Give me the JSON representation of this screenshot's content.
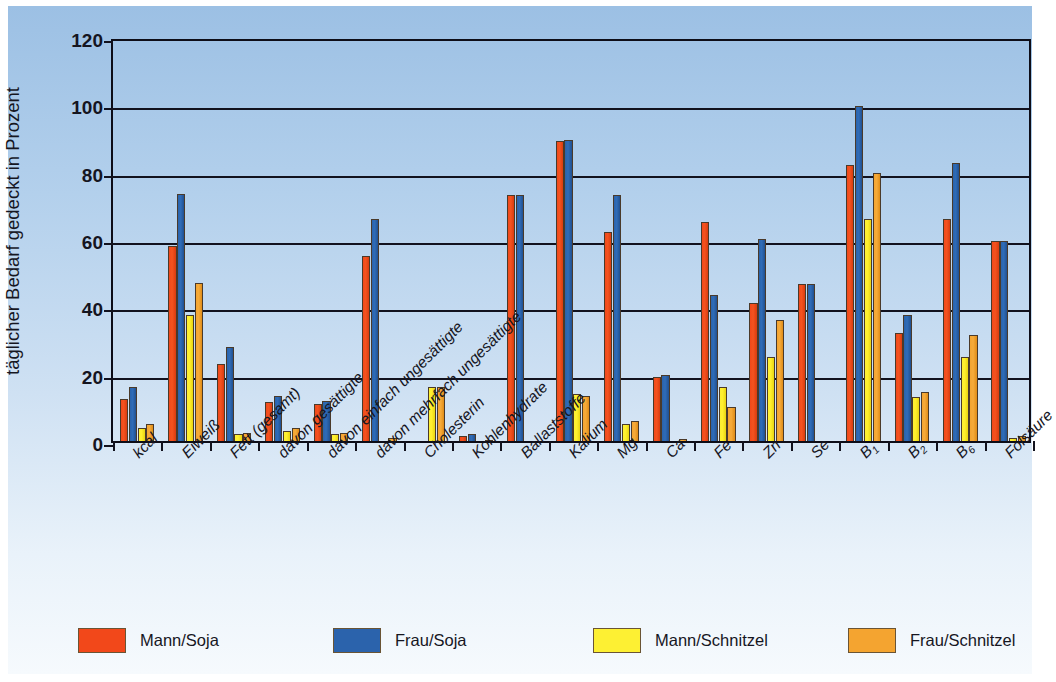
{
  "chart_data": {
    "type": "bar",
    "title": "",
    "xlabel": "",
    "ylabel": "täglicher Bedarf gedeckt in Prozent",
    "ylim": [
      0,
      120
    ],
    "yticks": [
      0,
      20,
      40,
      60,
      80,
      100,
      120
    ],
    "grid": true,
    "legend_position": "bottom",
    "categories": [
      "kcal",
      "Eiweiß",
      "Fett (gesamt)",
      "davon gesättigte",
      "davon einfach ungesättigte",
      "davon mehrfach ungesättigte",
      "Cholesterin",
      "Kohlenhydrate",
      "Ballaststoffe",
      "Kalium",
      "Mg",
      "Ca",
      "Fe",
      "Zn",
      "Se",
      "B1",
      "B2",
      "B6",
      "Folsäure"
    ],
    "category_labels": [
      {
        "base": "kcal",
        "sub": ""
      },
      {
        "base": "Eiweiß",
        "sub": ""
      },
      {
        "base": "Fett (gesamt)",
        "sub": ""
      },
      {
        "base": "davon gesättigte",
        "sub": ""
      },
      {
        "base": "davon einfach ungesättigte",
        "sub": ""
      },
      {
        "base": "davon mehrfach ungesättigte",
        "sub": ""
      },
      {
        "base": "Cholesterin",
        "sub": ""
      },
      {
        "base": "Kohlenhydrate",
        "sub": ""
      },
      {
        "base": "Ballaststoffe",
        "sub": ""
      },
      {
        "base": "Kalium",
        "sub": ""
      },
      {
        "base": "Mg",
        "sub": ""
      },
      {
        "base": "Ca",
        "sub": ""
      },
      {
        "base": "Fe",
        "sub": ""
      },
      {
        "base": "Zn",
        "sub": ""
      },
      {
        "base": "Se",
        "sub": ""
      },
      {
        "base": "B",
        "sub": "1"
      },
      {
        "base": "B",
        "sub": "2"
      },
      {
        "base": "B",
        "sub": "6"
      },
      {
        "base": "Folsäure",
        "sub": ""
      }
    ],
    "series": [
      {
        "name": "Mann/Soja",
        "color": "#F2481A",
        "values": [
          12.5,
          58,
          23,
          11.5,
          11,
          55,
          0,
          1.5,
          73,
          89,
          62,
          19,
          65,
          41,
          46.5,
          82,
          32,
          66,
          59.5
        ]
      },
      {
        "name": "Frau/Soja",
        "color": "#2B63AC",
        "values": [
          16,
          73.5,
          28,
          13.5,
          12,
          66,
          0,
          2,
          73,
          89.5,
          73,
          19.5,
          43.5,
          60,
          46.5,
          99.5,
          37.5,
          82.5,
          59.5
        ]
      },
      {
        "name": "Mann/Schnitzel",
        "color": "#FDF033",
        "values": [
          4,
          37.5,
          2,
          3,
          2,
          0,
          16,
          0,
          0,
          14,
          5,
          0,
          16,
          25,
          0,
          66,
          13,
          25,
          1
        ]
      },
      {
        "name": "Frau/Schnitzel",
        "color": "#F4A430",
        "values": [
          5,
          47,
          2.5,
          4,
          2.5,
          1,
          16,
          0.3,
          0,
          13.5,
          6,
          0.6,
          10,
          36,
          0,
          79.5,
          14.5,
          31.5,
          1.5
        ]
      }
    ]
  },
  "legend": {
    "items": [
      {
        "label": "Mann/Soja",
        "color": "#F2481A"
      },
      {
        "label": "Frau/Soja",
        "color": "#2B63AC"
      },
      {
        "label": "Mann/Schnitzel",
        "color": "#FDF033"
      },
      {
        "label": "Frau/Schnitzel",
        "color": "#F4A430"
      }
    ]
  },
  "axis": {
    "y_title": "täglicher Bedarf gedeckt in Prozent",
    "y_tick_labels": [
      "0",
      "20",
      "40",
      "60",
      "80",
      "100",
      "120"
    ]
  }
}
